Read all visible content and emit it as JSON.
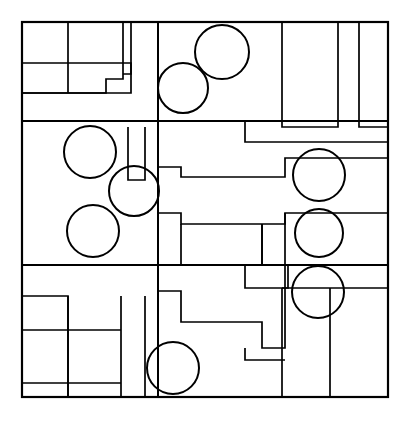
{
  "document": {
    "title": "Abstract Rectilinear Composition with Circles",
    "description": "Black line drawing on white ground: a square frame subdivided into nested rectangular cells with nine overlaid outline circles.",
    "width": 412,
    "height": 425,
    "background_color": "#ffffff",
    "stroke_color": "#000000"
  },
  "figure": {
    "name": "line-drawing",
    "frame": {
      "name": "outer-frame",
      "x": 22,
      "y": 22,
      "width": 366,
      "height": 375,
      "stroke_width": 2.2
    },
    "band_dividers": [
      {
        "name": "band-divider-upper",
        "x1": 22,
        "y1": 121,
        "x2": 388,
        "y2": 121,
        "stroke_width": 2.0
      },
      {
        "name": "band-divider-lower",
        "x1": 22,
        "y1": 265,
        "x2": 388,
        "y2": 265,
        "stroke_width": 2.0
      }
    ],
    "spine": {
      "name": "central-vertical-spine",
      "x1": 158,
      "y1": 22,
      "x2": 158,
      "y2": 397,
      "stroke_width": 2.0
    },
    "polylines": [
      {
        "name": "top-left-cluster-outer",
        "points": "22,63 131,63 131,93 22,93",
        "stroke_width": 1.7
      },
      {
        "name": "top-left-cell-divider-vertical",
        "points": "68,22 68,93",
        "stroke_width": 1.7
      },
      {
        "name": "top-left-lower-shelf",
        "points": "22,63 22,93",
        "stroke_width": 1.7
      },
      {
        "name": "top-left-step-outline",
        "points": "123,22 123,79 106,79 106,93 22,93",
        "stroke_width": 1.7
      },
      {
        "name": "top-narrow-strip",
        "points": "131,22 131,74 123,74",
        "stroke_width": 1.7
      },
      {
        "name": "top-right-pillar-left",
        "points": "282,22 282,127 338,127 338,22",
        "stroke_width": 1.7
      },
      {
        "name": "top-right-pillar-right",
        "points": "359,22 359,127 388,127",
        "stroke_width": 1.7
      },
      {
        "name": "upper-right-notch",
        "points": "388,142 245,142 245,121",
        "stroke_width": 1.7
      },
      {
        "name": "mid-staircase-main",
        "points": "158,167 181,167 181,177 285,177 285,158 388,158",
        "stroke_width": 1.7
      },
      {
        "name": "mid-staircase-lower",
        "points": "158,213 181,213 181,224 285,224 285,213 388,213",
        "stroke_width": 1.7
      },
      {
        "name": "mid-left-small-rect",
        "points": "128,127 128,180 145,180 145,127",
        "stroke_width": 1.7
      },
      {
        "name": "mid-center-inner-rect",
        "points": "181,224 181,265 262,265 262,224",
        "stroke_width": 1.7
      },
      {
        "name": "mid-center-rect-divider",
        "points": "262,224 262,265",
        "stroke_width": 1.7
      },
      {
        "name": "mid-right-divider",
        "points": "285,213 285,265",
        "stroke_width": 1.7
      },
      {
        "name": "mid-right-band-line",
        "points": "22,265 388,265",
        "stroke_width": 1.9
      },
      {
        "name": "lower-center-step",
        "points": "245,265 245,288 288,288 288,265",
        "stroke_width": 1.7
      },
      {
        "name": "lower-left-grid-outer",
        "points": "22,296 68,296 68,397",
        "stroke_width": 1.7
      },
      {
        "name": "lower-left-row-divider",
        "points": "22,330 121,330",
        "stroke_width": 1.7
      },
      {
        "name": "lower-left-top-rect",
        "points": "68,296 68,330",
        "stroke_width": 1.7
      },
      {
        "name": "lower-left-bottom-strip",
        "points": "22,383 121,383",
        "stroke_width": 1.7
      },
      {
        "name": "lower-left-vertical-mid",
        "points": "68,330 68,397",
        "stroke_width": 1.7
      },
      {
        "name": "lower-left-tall-column",
        "points": "121,296 121,397",
        "stroke_width": 1.7
      },
      {
        "name": "lower-left-column-inner",
        "points": "145,296 145,397",
        "stroke_width": 1.7
      },
      {
        "name": "lower-center-staircase",
        "points": "158,291 181,291 181,322 262,322 262,348 285,348 285,265",
        "stroke_width": 1.7
      },
      {
        "name": "lower-center-rect",
        "points": "158,397 158,291",
        "stroke_width": 1.7
      },
      {
        "name": "lower-right-step-bottom",
        "points": "245,348 245,360 285,360",
        "stroke_width": 1.7
      },
      {
        "name": "lower-right-column",
        "points": "282,288 282,397",
        "stroke_width": 1.7
      },
      {
        "name": "lower-right-block",
        "points": "330,288 330,397",
        "stroke_width": 1.7
      },
      {
        "name": "lower-right-top-edge",
        "points": "282,288 388,288",
        "stroke_width": 1.7
      }
    ],
    "circles": [
      {
        "name": "circle-top-right",
        "cx": 222,
        "cy": 52,
        "r": 27,
        "stroke_width": 2.0
      },
      {
        "name": "circle-top-center",
        "cx": 183,
        "cy": 88,
        "r": 25,
        "stroke_width": 2.0
      },
      {
        "name": "circle-mid-left-upper",
        "cx": 90,
        "cy": 152,
        "r": 26,
        "stroke_width": 2.0
      },
      {
        "name": "circle-mid-left-center",
        "cx": 134,
        "cy": 191,
        "r": 25,
        "stroke_width": 2.0
      },
      {
        "name": "circle-mid-left-lower",
        "cx": 93,
        "cy": 231,
        "r": 26,
        "stroke_width": 2.0
      },
      {
        "name": "circle-right-upper",
        "cx": 319,
        "cy": 175,
        "r": 26,
        "stroke_width": 2.0
      },
      {
        "name": "circle-right-middle",
        "cx": 319,
        "cy": 233,
        "r": 24,
        "stroke_width": 2.0
      },
      {
        "name": "circle-right-lower",
        "cx": 318,
        "cy": 292,
        "r": 26,
        "stroke_width": 2.0
      },
      {
        "name": "circle-bottom-center",
        "cx": 173,
        "cy": 368,
        "r": 26,
        "stroke_width": 2.0
      }
    ]
  }
}
